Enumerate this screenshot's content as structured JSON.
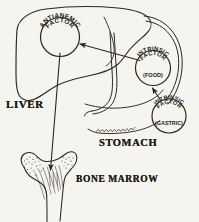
{
  "figure": {
    "ink_color": "#2b2724",
    "background_color": "#f6f4ef"
  },
  "organs": [
    {
      "key": "liver",
      "label": "LIVER"
    },
    {
      "key": "stomach",
      "label": "STOMACH"
    },
    {
      "key": "bone_marrow",
      "label": "BONE MARROW"
    }
  ],
  "nodes": [
    {
      "key": "antianemic_factor",
      "line1": "ANTIANEMIC",
      "line2": "FACTOR",
      "sub": "",
      "location": "liver"
    },
    {
      "key": "intrinsic_factor_food",
      "line1": "INTRINSIC",
      "line2": "FACTOR",
      "sub": "(FOOD)",
      "location": "stomach"
    },
    {
      "key": "intrinsic_factor_gastric",
      "line1": "INTRINSIC",
      "line2": "FACTOR",
      "sub": "(GASTRIC)",
      "location": "stomach"
    }
  ],
  "arrows": [
    {
      "key": "gastric-to-food",
      "from": "intrinsic_factor_gastric",
      "to": "intrinsic_factor_food"
    },
    {
      "key": "food-to-liver",
      "from": "intrinsic_factor_food",
      "to": "antianemic_factor"
    },
    {
      "key": "liver-to-marrow",
      "from": "antianemic_factor",
      "to": "bone_marrow"
    }
  ]
}
